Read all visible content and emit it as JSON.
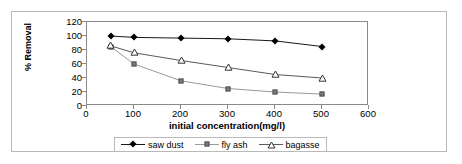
{
  "chart_data": {
    "type": "line",
    "title": "",
    "xlabel": "initial concentration(mg/l)",
    "ylabel": "% Removal",
    "x": [
      50,
      100,
      200,
      300,
      400,
      500
    ],
    "xlim": [
      0,
      600
    ],
    "ylim": [
      0,
      120
    ],
    "xticks": [
      0,
      100,
      200,
      300,
      400,
      500,
      600
    ],
    "yticks": [
      0,
      20,
      40,
      60,
      80,
      100,
      120
    ],
    "grid": false,
    "legend_position": "bottom",
    "series": [
      {
        "name": "saw dust",
        "marker": "filled-diamond",
        "color": "#000000",
        "values": [
          100,
          98,
          97,
          96,
          93,
          85
        ]
      },
      {
        "name": "fly ash",
        "marker": "filled-square",
        "color": "#7a7a7a",
        "values": [
          85,
          60,
          36,
          25,
          20,
          17
        ]
      },
      {
        "name": "bagasse",
        "marker": "open-triangle",
        "color": "#5a5a5a",
        "values": [
          86,
          76,
          65,
          55,
          45,
          40
        ]
      }
    ]
  },
  "axis": {
    "x_tick_labels": [
      "0",
      "100",
      "200",
      "300",
      "400",
      "500",
      "600"
    ],
    "y_tick_labels": [
      "0",
      "20",
      "40",
      "60",
      "80",
      "100",
      "120"
    ],
    "x_title": "initial concentration(mg/l)",
    "y_title": "% Removal"
  },
  "legend": {
    "entries": [
      {
        "label": "saw dust",
        "icon": "filled-diamond-marker-icon"
      },
      {
        "label": "fly ash",
        "icon": "filled-square-marker-icon"
      },
      {
        "label": "bagasse",
        "icon": "open-triangle-marker-icon"
      }
    ]
  },
  "colors": {
    "sawdust_line": "#1a1a1a",
    "flyash_line": "#9a9a9a",
    "bagasse_line": "#5a5a5a",
    "axis": "#8a8a8a",
    "frame": "#b9b9b9",
    "text": "#000000"
  }
}
